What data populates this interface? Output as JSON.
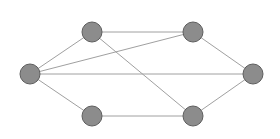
{
  "diagram": {
    "type": "undirected-graph",
    "colors": {
      "background": "#ffffff",
      "node_fill": "#8c8c8c",
      "node_stroke": "#5e5e5e",
      "edge": "#a0a0a0"
    },
    "node_radius": 10,
    "nodes": [
      {
        "id": "A",
        "x": 30,
        "y": 74
      },
      {
        "id": "B",
        "x": 92,
        "y": 32
      },
      {
        "id": "C",
        "x": 193,
        "y": 32
      },
      {
        "id": "D",
        "x": 253,
        "y": 74
      },
      {
        "id": "E",
        "x": 92,
        "y": 116
      },
      {
        "id": "F",
        "x": 193,
        "y": 116
      }
    ],
    "edges": [
      {
        "from": "A",
        "to": "B"
      },
      {
        "from": "A",
        "to": "C"
      },
      {
        "from": "A",
        "to": "D"
      },
      {
        "from": "A",
        "to": "E"
      },
      {
        "from": "B",
        "to": "C"
      },
      {
        "from": "B",
        "to": "F"
      },
      {
        "from": "C",
        "to": "D"
      },
      {
        "from": "D",
        "to": "F"
      },
      {
        "from": "E",
        "to": "F"
      }
    ]
  }
}
